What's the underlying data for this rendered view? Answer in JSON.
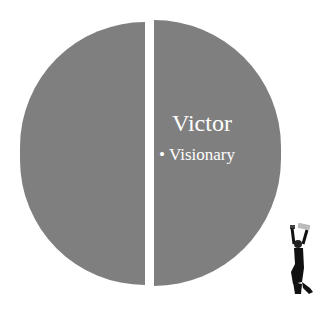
{
  "diagram": {
    "type": "split-circle",
    "fill_color": "#7f7f7f",
    "text_color": "#ffffff",
    "right_half": {
      "title": "Victor",
      "bullets": [
        "Visionary"
      ],
      "bullet_glyph": "•"
    },
    "left_half": {
      "title": ""
    }
  },
  "decorations": {
    "figure": "jumping-person-silhouette-icon"
  }
}
